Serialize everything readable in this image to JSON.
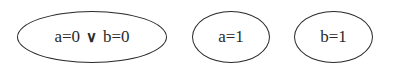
{
  "diagram": {
    "nodes": [
      {
        "id": "n1",
        "left": "a=0",
        "operator": "∨",
        "right": "b=0",
        "x": 17,
        "y": 11,
        "w": 150,
        "h": 52
      },
      {
        "id": "n2",
        "label": "a=1",
        "x": 192,
        "y": 11,
        "w": 78,
        "h": 52
      },
      {
        "id": "n3",
        "label": "b=1",
        "x": 294,
        "y": 11,
        "w": 79,
        "h": 52
      }
    ],
    "stroke_color": "#2a2a2a",
    "background": "#ffffff"
  }
}
